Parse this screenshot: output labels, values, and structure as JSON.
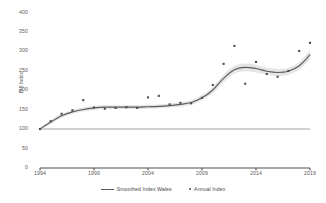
{
  "chart_data": {
    "type": "line",
    "title": "",
    "xlabel": "",
    "ylabel": "BIS Index",
    "xlim": [
      1994,
      2019
    ],
    "ylim": [
      0,
      400
    ],
    "grid": false,
    "legend_position": "bottom",
    "yticks": [
      0,
      50,
      100,
      150,
      200,
      250,
      300,
      350,
      400
    ],
    "xticks": [
      1994,
      1999,
      2004,
      2009,
      2014,
      2019
    ],
    "reference_line": {
      "value": 100,
      "label": ""
    },
    "series": [
      {
        "name": "Smoothed Index Wales",
        "type": "line",
        "color": "#5c5c5c",
        "band_color": "#e2e2e2",
        "x": [
          1994,
          1995,
          1996,
          1997,
          1998,
          1999,
          2000,
          2001,
          2002,
          2003,
          2004,
          2005,
          2006,
          2007,
          2008,
          2009,
          2010,
          2011,
          2012,
          2013,
          2014,
          2015,
          2016,
          2017,
          2018,
          2019
        ],
        "values": [
          100,
          118,
          134,
          144,
          150,
          154,
          156,
          156,
          156,
          156,
          157,
          158,
          160,
          163,
          168,
          180,
          200,
          230,
          252,
          258,
          255,
          248,
          245,
          248,
          262,
          290
        ],
        "band_upper": [
          103,
          123,
          139,
          149,
          155,
          159,
          161,
          161,
          161,
          161,
          162,
          163,
          165,
          169,
          174,
          187,
          208,
          240,
          262,
          268,
          265,
          257,
          254,
          257,
          272,
          302
        ],
        "band_lower": [
          97,
          113,
          129,
          139,
          145,
          149,
          151,
          151,
          151,
          151,
          152,
          153,
          155,
          157,
          162,
          173,
          192,
          220,
          242,
          248,
          245,
          239,
          236,
          239,
          252,
          278
        ]
      },
      {
        "name": "Annual Index",
        "type": "scatter",
        "color": "#4b4b52",
        "x": [
          1994,
          1995,
          1996,
          1997,
          1998,
          1999,
          2000,
          2001,
          2002,
          2003,
          2004,
          2005,
          2006,
          2007,
          2008,
          2009,
          2010,
          2011,
          2012,
          2013,
          2014,
          2015,
          2016,
          2017,
          2018,
          2019
        ],
        "values": [
          100,
          120,
          139,
          148,
          174,
          155,
          152,
          154,
          156,
          154,
          181,
          185,
          163,
          167,
          166,
          180,
          213,
          267,
          313,
          216,
          272,
          241,
          234,
          249,
          300,
          321
        ]
      }
    ]
  },
  "legend": {
    "items": [
      {
        "label": "Smoothed Index Wales",
        "marker": "line-marker"
      },
      {
        "label": "Annual Index",
        "marker": "dot-marker"
      }
    ]
  }
}
